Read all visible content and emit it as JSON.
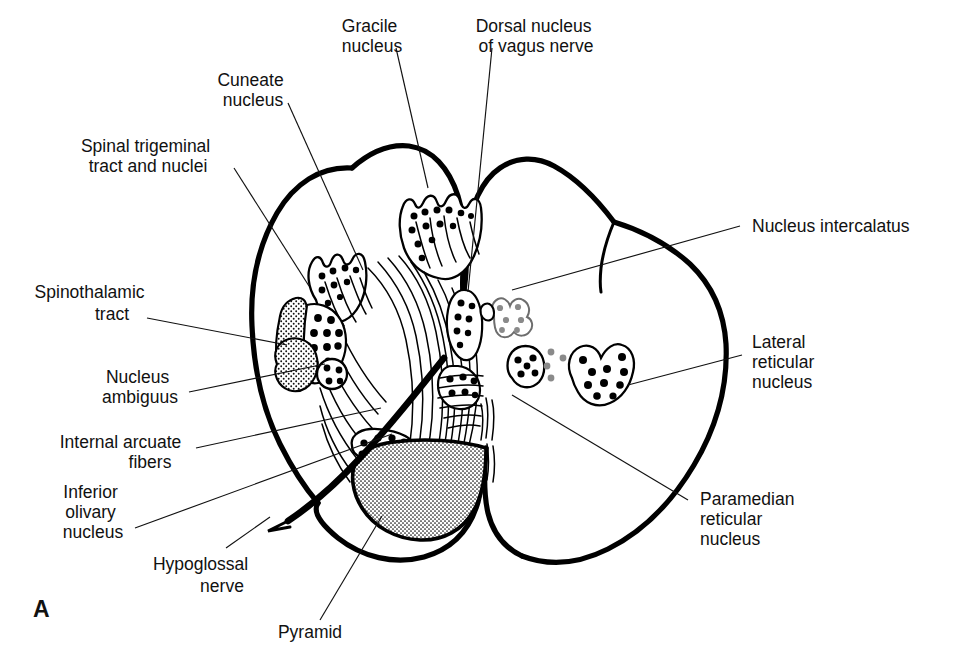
{
  "figure": {
    "panel_letter": "A",
    "background_color": "#ffffff",
    "ink_color": "#000000",
    "accent_grey": "#8a8a8a"
  },
  "labels": {
    "gracile_nucleus": {
      "lines": [
        "Gracile",
        "nucleus"
      ],
      "anchor": "middle",
      "x": 372,
      "y": 32
    },
    "dorsal_nucleus_vagus": {
      "lines": [
        "Dorsal nucleus",
        "of vagus nerve"
      ],
      "anchor": "middle",
      "x": 536,
      "y": 32
    },
    "cuneate_nucleus": {
      "lines": [
        "Cuneate",
        "nucleus"
      ],
      "anchor": "middle",
      "x": 253,
      "y": 86
    },
    "spinal_trigeminal": {
      "lines": [
        "Spinal trigeminal",
        "tract and nuclei"
      ],
      "anchor": "middle",
      "x": 148,
      "y": 152
    },
    "spinothalamic_tract": {
      "lines": [
        "Spinothalamic",
        "tract"
      ],
      "anchor": "middle",
      "x": 92,
      "y": 298
    },
    "nucleus_ambiguus": {
      "lines": [
        "Nucleus",
        "ambiguus"
      ],
      "anchor": "middle",
      "x": 140,
      "y": 400
    },
    "internal_arcuate_fibers": {
      "lines": [
        "Internal arcuate",
        "fibers"
      ],
      "anchor": "middle",
      "x": 123,
      "y": 457
    },
    "inferior_olivary_nucleus": {
      "lines": [
        "Inferior",
        "olivary",
        "nucleus"
      ],
      "anchor": "middle",
      "x": 93,
      "y": 505
    },
    "hypoglossal_nerve": {
      "lines": [
        "Hypoglossal",
        "nerve"
      ],
      "anchor": "middle",
      "x": 203,
      "y": 570
    },
    "pyramid": {
      "lines": [
        "Pyramid"
      ],
      "anchor": "middle",
      "x": 310,
      "y": 638
    },
    "nucleus_intercalatus": {
      "lines": [
        "Nucleus intercalatus"
      ],
      "anchor": "start",
      "x": 752,
      "y": 232
    },
    "lateral_reticular_nucleus": {
      "lines": [
        "Lateral",
        "reticular",
        "nucleus"
      ],
      "anchor": "start",
      "x": 752,
      "y": 348
    },
    "paramedian_reticular_nucleus": {
      "lines": [
        "Paramedian",
        "reticular",
        "nucleus"
      ],
      "anchor": "start",
      "x": 700,
      "y": 505
    }
  },
  "leader_lines": [
    {
      "name": "gracile-leader",
      "from": [
        396,
        48
      ],
      "to": [
        428,
        188
      ]
    },
    {
      "name": "dorsal-vagus-leader",
      "from": [
        492,
        48
      ],
      "to": [
        468,
        292
      ]
    },
    {
      "name": "cuneate-leader",
      "from": [
        288,
        103
      ],
      "to": [
        363,
        270
      ]
    },
    {
      "name": "spinal-trigeminal-leader",
      "from": [
        234,
        168
      ],
      "to": [
        309,
        286
      ]
    },
    {
      "name": "spinothalamic-leader",
      "from": [
        147,
        318
      ],
      "to": [
        287,
        345
      ]
    },
    {
      "name": "nucleus-ambiguus-leader",
      "from": [
        189,
        392
      ],
      "to": [
        325,
        364
      ]
    },
    {
      "name": "internal-arcuate-leader",
      "from": [
        196,
        448
      ],
      "to": [
        381,
        408
      ]
    },
    {
      "name": "inferior-olivary-leader",
      "from": [
        135,
        528
      ],
      "to": [
        392,
        434
      ]
    },
    {
      "name": "hypoglossal-leader",
      "from": [
        226,
        548
      ],
      "to": [
        270,
        517
      ]
    },
    {
      "name": "pyramid-leader",
      "from": [
        320,
        620
      ],
      "to": [
        382,
        516
      ]
    },
    {
      "name": "nucleus-intercalatus-leader",
      "from": [
        740,
        226
      ],
      "to": [
        512,
        290
      ]
    },
    {
      "name": "lateral-reticular-leader",
      "from": [
        742,
        355
      ],
      "to": [
        628,
        385
      ]
    },
    {
      "name": "paramedian-reticular-leader",
      "from": [
        688,
        500
      ],
      "to": [
        512,
        395
      ]
    }
  ],
  "structures": [
    {
      "name": "medulla-outline",
      "fill": "none",
      "stroke_weight": "thick"
    },
    {
      "name": "gracile-nucleus-body",
      "type": "nucleus",
      "cells": 12
    },
    {
      "name": "cuneate-nucleus-body",
      "type": "nucleus",
      "cells": 11
    },
    {
      "name": "spinal-trigeminal-tract",
      "type": "stippled-tract"
    },
    {
      "name": "spinal-trigeminal-nucleus",
      "type": "nucleus",
      "cells": 11
    },
    {
      "name": "spinothalamic-tract",
      "type": "stippled-tract"
    },
    {
      "name": "nucleus-ambiguus",
      "type": "nucleus",
      "cells": 4
    },
    {
      "name": "dorsal-vagus-nucleus",
      "type": "nucleus",
      "cells": 8
    },
    {
      "name": "hypoglossal-nucleus",
      "type": "nucleus",
      "cells": 6
    },
    {
      "name": "nucleus-intercalatus",
      "type": "nucleus-grey",
      "cells": 6
    },
    {
      "name": "internal-arcuate-fibers",
      "type": "fiber-bundle"
    },
    {
      "name": "inferior-olivary-nucleus",
      "type": "nucleus",
      "cells": 8
    },
    {
      "name": "pyramid",
      "type": "stippled-tract"
    },
    {
      "name": "paramedian-reticular-nucleus",
      "type": "nucleus",
      "cells": 5
    },
    {
      "name": "lateral-reticular-nucleus",
      "type": "nucleus",
      "cells": 11
    },
    {
      "name": "hypoglossal-nerve",
      "type": "thick-nerve"
    },
    {
      "name": "median-raphe",
      "type": "fiber-bundle"
    }
  ]
}
